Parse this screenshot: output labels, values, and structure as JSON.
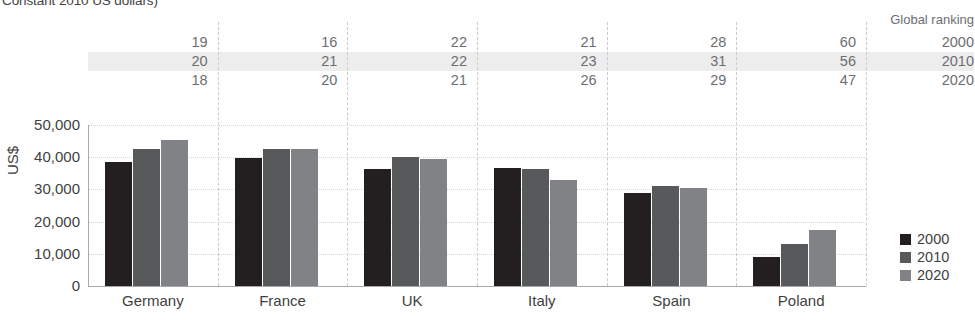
{
  "title": "Constant 2010 US dollars)",
  "legend": {
    "items": [
      {
        "label": "2000",
        "color": "#231f20"
      },
      {
        "label": "2010",
        "color": "#58595b"
      },
      {
        "label": "2020",
        "color": "#808285"
      }
    ]
  },
  "ranking_table": {
    "header": "Global ranking",
    "row_years": [
      "2000",
      "2010",
      "2020"
    ],
    "highlighted_row": "2010",
    "rows": [
      {
        "year": "2000",
        "values": [
          "19",
          "16",
          "22",
          "21",
          "28",
          "60"
        ]
      },
      {
        "year": "2010",
        "values": [
          "20",
          "21",
          "22",
          "23",
          "31",
          "56"
        ]
      },
      {
        "year": "2020",
        "values": [
          "18",
          "20",
          "21",
          "26",
          "29",
          "47"
        ]
      }
    ]
  },
  "chart_data": {
    "type": "bar",
    "title": "Constant 2010 US dollars)",
    "xlabel": "",
    "ylabel": "US$",
    "ylim": [
      0,
      50000
    ],
    "yticks": [
      "0",
      "10,000",
      "20,000",
      "30,000",
      "40,000",
      "50,000"
    ],
    "ytick_values": [
      0,
      10000,
      20000,
      30000,
      40000,
      50000
    ],
    "grid": true,
    "legend_position": "right",
    "categories": [
      "Germany",
      "France",
      "UK",
      "Italy",
      "Spain",
      "Poland"
    ],
    "series": [
      {
        "name": "2000",
        "color": "#231f20",
        "values": [
          38400,
          39900,
          36400,
          36800,
          29000,
          9000
        ]
      },
      {
        "name": "2010",
        "color": "#58595b",
        "values": [
          42600,
          42400,
          40000,
          36300,
          31000,
          13200
        ]
      },
      {
        "name": "2020",
        "color": "#808285",
        "values": [
          45500,
          42400,
          39500,
          32800,
          30300,
          17300
        ]
      }
    ],
    "annotations": {
      "global_ranking_2000": [
        19,
        16,
        22,
        21,
        28,
        60
      ],
      "global_ranking_2010": [
        20,
        21,
        22,
        23,
        31,
        56
      ],
      "global_ranking_2020": [
        18,
        20,
        21,
        26,
        29,
        47
      ]
    }
  }
}
